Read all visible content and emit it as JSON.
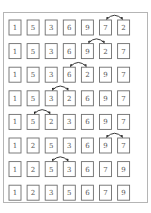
{
  "rows": [
    {
      "values": [
        "1",
        "5",
        "3",
        "6",
        "9",
        "7",
        "2"
      ],
      "swap": [
        5,
        6
      ]
    },
    {
      "values": [
        "1",
        "5",
        "3",
        "6",
        "9",
        "2",
        "7"
      ],
      "swap": [
        4,
        5
      ]
    },
    {
      "values": [
        "1",
        "5",
        "3",
        "6",
        "2",
        "9",
        "7"
      ],
      "swap": [
        3,
        4
      ]
    },
    {
      "values": [
        "1",
        "5",
        "3",
        "2",
        "6",
        "9",
        "7"
      ],
      "swap": [
        2,
        3
      ]
    },
    {
      "values": [
        "1",
        "5",
        "2",
        "3",
        "6",
        "9",
        "7"
      ],
      "swap": [
        1,
        2
      ]
    },
    {
      "values": [
        "1",
        "2",
        "5",
        "3",
        "6",
        "9",
        "7"
      ],
      "swap": [
        5,
        6
      ]
    },
    {
      "values": [
        "1",
        "2",
        "5",
        "3",
        "6",
        "7",
        "9"
      ],
      "swap": [
        2,
        3
      ]
    },
    {
      "values": [
        "1",
        "2",
        "3",
        "5",
        "6",
        "7",
        "9"
      ],
      "swap": null
    }
  ]
}
